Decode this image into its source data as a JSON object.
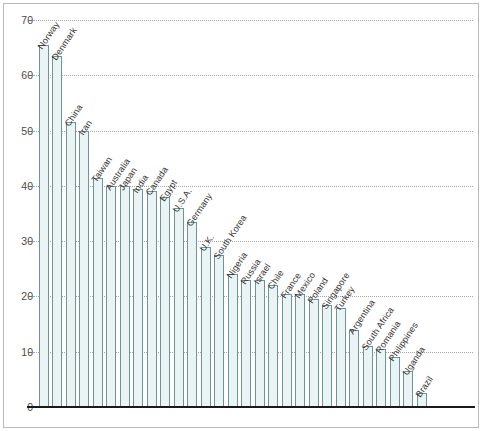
{
  "chart_data": {
    "type": "bar",
    "title": "",
    "subtitle": "",
    "xlabel": "",
    "ylabel": "",
    "ylim": [
      0,
      70
    ],
    "yticks": [
      0,
      10,
      20,
      30,
      40,
      50,
      60,
      70
    ],
    "ytick_labels": [
      "0",
      "10",
      "20",
      "30",
      "40",
      "50",
      "60",
      "70"
    ],
    "grid": true,
    "legend": false,
    "legend_position": "none",
    "annotations": [],
    "categories": [
      "Norway",
      "Denmark",
      "China",
      "Iran",
      "Taiwan",
      "Australia",
      "Japan",
      "India",
      "Canada",
      "Egypt",
      "U.S.A.",
      "Germany",
      "U.K.",
      "South Korea",
      "Nigeria",
      "Russia",
      "Israel",
      "Chile",
      "France",
      "Mexico",
      "Poland",
      "Singapore",
      "Turkey",
      "Argentina",
      "South Africa",
      "Romania",
      "Philippines",
      "Uganda",
      "Brazil"
    ],
    "values": [
      65.5,
      63.5,
      51.5,
      50,
      41.5,
      40,
      40,
      39.5,
      39,
      38,
      36,
      33.5,
      29,
      27.5,
      24,
      23,
      23,
      22,
      20.5,
      20.5,
      19.5,
      18.5,
      18,
      14,
      11,
      10.5,
      9,
      6.5,
      2.5
    ],
    "colors": {
      "bar_fill": "#eaf4f5",
      "bar_border": "#6e9497",
      "gridline": "#a7a7a7",
      "axis": "#1a1a1a",
      "frame": "#b9b9b9",
      "text": "#333333"
    }
  }
}
